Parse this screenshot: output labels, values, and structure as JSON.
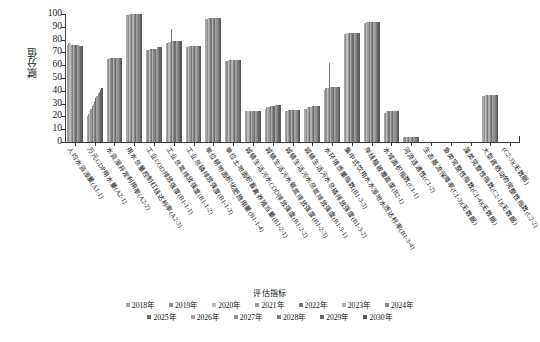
{
  "chart_data": {
    "type": "bar",
    "title": "",
    "xlabel": "评估指标",
    "ylabel": "赋分值",
    "ylim": [
      0,
      100
    ],
    "yticks": [
      0,
      10,
      20,
      30,
      40,
      50,
      60,
      70,
      80,
      90,
      100
    ],
    "grid": false,
    "legend_title": "评估指标",
    "legend_position": "bottom",
    "categories": [
      "人均水资源量(A1-1)",
      "万元GDP用水量(A2-1)",
      "水资源开发利用率(A2-2)",
      "用水总量控制红线达标率(A2-3)",
      "工业COD排放强度(B1-1-1)",
      "工业总氮排放强度(B1-1-2)",
      "工业总磷排放强度(B1-1-3)",
      "单位耕地面积化肥施用量(B1-1-4)",
      "单位土地面积畜禽养殖当量(B1-2-1)",
      "城镇生活污水COD排放强度(B1-2-2)",
      "城镇生活污水氨氮排放强度(B1-2-3)",
      "城镇生活污水总氮排放强度(B1-3-1)",
      "城镇生活污水总磷排放强度(B1-3-2)",
      "水环境质量指数(B1-3-3)",
      "集中式饮用水水源地水质达标率(B1-3-4)",
      "岸线植被覆盖度(B2-1)",
      "水域面积指数(C1-1)",
      "河流连通性(C1-2)",
      "生态基流保障率(C1-3)(无数据)",
      "鱼类完整性指数(C1-4)(无数据)",
      "藻类完整性指数(C2-1)(无数据)",
      "大型底栖动物完整性指数(C2-2)",
      "(C2-3)(无数据)"
    ],
    "series": [
      {
        "name": "2018年",
        "color": "#a8a8a8",
        "values": [
          76,
          20,
          65,
          99,
          72,
          77,
          74,
          96,
          63,
          24,
          26,
          24,
          26,
          41,
          84,
          93,
          23,
          4,
          0,
          0,
          0,
          36,
          0
        ]
      },
      {
        "name": "2019年",
        "color": "#8f8f8f",
        "values": [
          77,
          22,
          65,
          99,
          72,
          77,
          74,
          96,
          63,
          24,
          27,
          24,
          26,
          42,
          84,
          93,
          23,
          4,
          0,
          0,
          0,
          36,
          0
        ]
      },
      {
        "name": "2020年",
        "color": "#bdbdbd",
        "values": [
          77,
          24,
          66,
          100,
          73,
          78,
          75,
          97,
          64,
          24,
          27,
          24,
          27,
          42,
          85,
          94,
          24,
          4,
          0,
          0,
          0,
          37,
          0
        ]
      },
      {
        "name": "2021年",
        "color": "#9a9a9a",
        "values": [
          76,
          26,
          66,
          100,
          73,
          78,
          75,
          97,
          64,
          24,
          27,
          25,
          27,
          42,
          85,
          94,
          24,
          4,
          0,
          0,
          0,
          37,
          0
        ]
      },
      {
        "name": "2022年",
        "color": "#787878",
        "values": [
          76,
          28,
          66,
          100,
          73,
          88,
          75,
          97,
          64,
          24,
          28,
          25,
          27,
          62,
          85,
          94,
          24,
          4,
          0,
          0,
          0,
          37,
          0
        ]
      },
      {
        "name": "2023年",
        "color": "#b0b0b0",
        "values": [
          76,
          30,
          66,
          100,
          73,
          79,
          75,
          97,
          64,
          24,
          28,
          25,
          27,
          43,
          85,
          94,
          24,
          4,
          0,
          0,
          0,
          37,
          0
        ]
      },
      {
        "name": "2024年",
        "color": "#878787",
        "values": [
          76,
          32,
          66,
          100,
          73,
          79,
          75,
          97,
          64,
          24,
          28,
          25,
          28,
          43,
          85,
          94,
          24,
          4,
          0,
          0,
          0,
          37,
          0
        ]
      },
      {
        "name": "2025年",
        "color": "#6e6e6e",
        "values": [
          76,
          34,
          66,
          100,
          73,
          79,
          75,
          97,
          64,
          24,
          28,
          25,
          28,
          43,
          85,
          94,
          24,
          4,
          0,
          0,
          0,
          37,
          0
        ]
      },
      {
        "name": "2026年",
        "color": "#a0a0a0",
        "values": [
          76,
          36,
          66,
          100,
          73,
          79,
          75,
          97,
          64,
          24,
          29,
          25,
          28,
          43,
          85,
          94,
          24,
          4,
          0,
          0,
          0,
          37,
          0
        ]
      },
      {
        "name": "2027年",
        "color": "#929292",
        "values": [
          76,
          38,
          66,
          100,
          74,
          79,
          75,
          97,
          64,
          24,
          29,
          25,
          28,
          43,
          85,
          94,
          24,
          4,
          0,
          0,
          0,
          37,
          0
        ]
      },
      {
        "name": "2028年",
        "color": "#7e7e7e",
        "values": [
          75,
          39,
          66,
          100,
          74,
          79,
          75,
          97,
          64,
          24,
          29,
          25,
          28,
          43,
          85,
          94,
          24,
          4,
          0,
          0,
          0,
          37,
          0
        ]
      },
      {
        "name": "2029年",
        "color": "#666666",
        "values": [
          75,
          41,
          66,
          100,
          74,
          79,
          75,
          97,
          64,
          24,
          29,
          25,
          28,
          43,
          85,
          94,
          24,
          4,
          0,
          0,
          0,
          37,
          0
        ]
      },
      {
        "name": "2030年",
        "color": "#595959",
        "values": [
          75,
          42,
          66,
          100,
          74,
          79,
          75,
          97,
          64,
          24,
          29,
          25,
          28,
          43,
          85,
          94,
          24,
          4,
          0,
          0,
          0,
          37,
          0
        ]
      }
    ]
  }
}
